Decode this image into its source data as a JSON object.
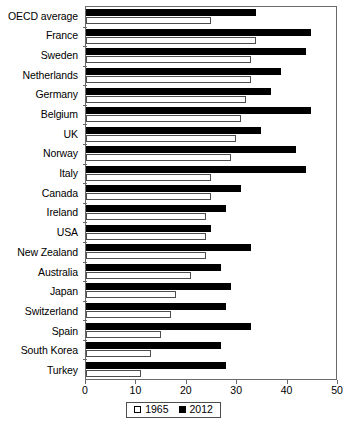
{
  "chart_data": {
    "type": "bar",
    "orientation": "horizontal",
    "title": "",
    "xlabel": "",
    "ylabel": "",
    "xlim": [
      0,
      50
    ],
    "xticks": [
      0,
      10,
      20,
      30,
      40,
      50
    ],
    "grid": false,
    "legend_position": "bottom-center",
    "categories": [
      "OECD average",
      "France",
      "Sweden",
      "Netherlands",
      "Germany",
      "Belgium",
      "UK",
      "Norway",
      "Italy",
      "Canada",
      "Ireland",
      "USA",
      "New Zealand",
      "Australia",
      "Japan",
      "Switzerland",
      "Spain",
      "South Korea",
      "Turkey"
    ],
    "series": [
      {
        "name": "2012",
        "color": "#000000",
        "values": [
          34,
          45,
          44,
          39,
          37,
          45,
          35,
          42,
          44,
          31,
          28,
          25,
          33,
          27,
          29,
          28,
          33,
          27,
          28
        ]
      },
      {
        "name": "1965",
        "color": "#ffffff",
        "values": [
          25,
          34,
          33,
          33,
          32,
          31,
          30,
          29,
          25,
          25,
          24,
          24,
          24,
          21,
          18,
          17,
          15,
          13,
          11
        ]
      }
    ]
  },
  "legend": {
    "entries": [
      {
        "label": "1965",
        "swatch": "open-square-icon"
      },
      {
        "label": "2012",
        "swatch": "filled-square-icon"
      }
    ]
  }
}
